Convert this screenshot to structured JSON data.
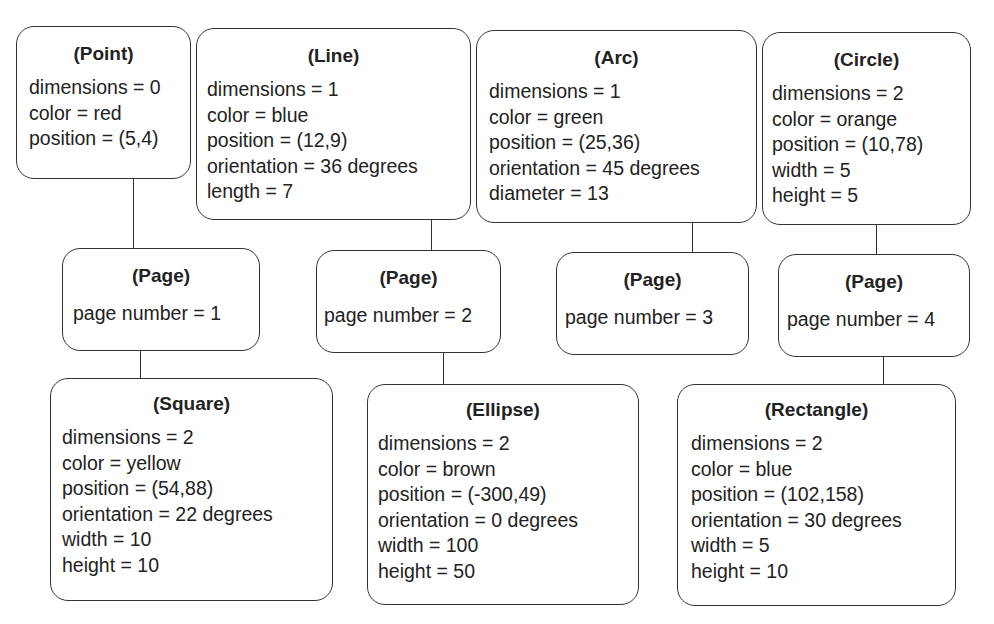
{
  "diagram": {
    "nodes": [
      {
        "id": "point",
        "title": "(Point)",
        "attributes": [
          "dimensions = 0",
          "color = red",
          "position = (5,4)"
        ]
      },
      {
        "id": "line",
        "title": "(Line)",
        "attributes": [
          "dimensions = 1",
          "color = blue",
          "position = (12,9)",
          "orientation = 36 degrees",
          "length = 7"
        ]
      },
      {
        "id": "arc",
        "title": "(Arc)",
        "attributes": [
          "dimensions = 1",
          "color = green",
          "position = (25,36)",
          "orientation = 45 degrees",
          "diameter = 13"
        ]
      },
      {
        "id": "circle",
        "title": "(Circle)",
        "attributes": [
          "dimensions = 2",
          "color = orange",
          "position = (10,78)",
          "width = 5",
          "height = 5"
        ]
      },
      {
        "id": "page1",
        "title": "(Page)",
        "attributes": [
          "page number = 1"
        ]
      },
      {
        "id": "page2",
        "title": "(Page)",
        "attributes": [
          "page number = 2"
        ]
      },
      {
        "id": "page3",
        "title": "(Page)",
        "attributes": [
          "page number = 3"
        ]
      },
      {
        "id": "page4",
        "title": "(Page)",
        "attributes": [
          "page number = 4"
        ]
      },
      {
        "id": "square",
        "title": "(Square)",
        "attributes": [
          "dimensions = 2",
          "color = yellow",
          "position = (54,88)",
          "orientation = 22 degrees",
          "width = 10",
          "height = 10"
        ]
      },
      {
        "id": "ellipse",
        "title": "(Ellipse)",
        "attributes": [
          "dimensions = 2",
          "color = brown",
          "position = (-300,49)",
          "orientation = 0 degrees",
          "width = 100",
          "height = 50"
        ]
      },
      {
        "id": "rectangle",
        "title": "(Rectangle)",
        "attributes": [
          "dimensions = 2",
          "color = blue",
          "position = (102,158)",
          "orientation = 30 degrees",
          "width = 5",
          "height = 10"
        ]
      }
    ],
    "edges": [
      {
        "from": "point",
        "to": "page1"
      },
      {
        "from": "page1",
        "to": "square"
      },
      {
        "from": "line",
        "to": "page2"
      },
      {
        "from": "page2",
        "to": "ellipse"
      },
      {
        "from": "arc",
        "to": "page3"
      },
      {
        "from": "circle",
        "to": "page4"
      },
      {
        "from": "page4",
        "to": "rectangle"
      }
    ]
  }
}
